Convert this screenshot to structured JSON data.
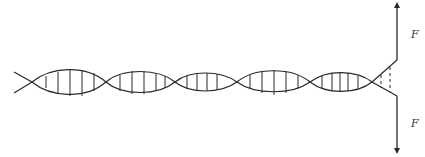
{
  "diagram": {
    "labels": {
      "force_top": "F",
      "force_bottom": "F"
    },
    "colors": {
      "stroke": "#2a2a2a",
      "background": "#ffffff"
    },
    "helix": {
      "center_y": 82,
      "crossings_x": [
        32,
        106,
        175,
        237,
        310,
        372
      ],
      "amplitudes": [
        15,
        14,
        11,
        15,
        12
      ]
    },
    "forces": [
      {
        "name": "top-force",
        "direction": "up",
        "x": 397,
        "from_y": 60,
        "to_y": 4
      },
      {
        "name": "bottom-force",
        "direction": "down",
        "x": 397,
        "from_y": 96,
        "to_y": 152
      }
    ]
  }
}
